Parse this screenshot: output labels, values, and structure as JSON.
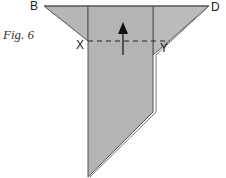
{
  "figure": {
    "caption": "Fig. 6",
    "points": {
      "B": "B",
      "D": "D",
      "X": "X",
      "Y": "Y"
    },
    "colors": {
      "paper_fill": "#b4b4b4",
      "paper_fill_light": "#bebebe",
      "edge": "#555555",
      "background": "#ffffff"
    },
    "annotations": {
      "fold_line": "dashed horizontal line from X to Y",
      "arrow": "upward arrow indicating fold direction"
    }
  }
}
